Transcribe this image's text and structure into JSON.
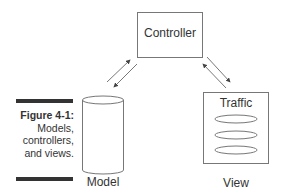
{
  "figure": {
    "number_label": "Figure 4-1:",
    "caption_lines": [
      "Models,",
      "controllers,",
      "and views."
    ]
  },
  "diagram": {
    "controller": {
      "label": "Controller"
    },
    "model": {
      "label": "Model"
    },
    "view": {
      "label": "View",
      "inner_title": "Traffic",
      "item_count": 3
    },
    "connections": [
      {
        "from": "Model",
        "to": "Controller",
        "bidirectional": true
      },
      {
        "from": "Controller",
        "to": "View",
        "bidirectional": true
      }
    ]
  },
  "colors": {
    "stroke": "#555555",
    "text": "#333333",
    "bar": "#333333"
  }
}
